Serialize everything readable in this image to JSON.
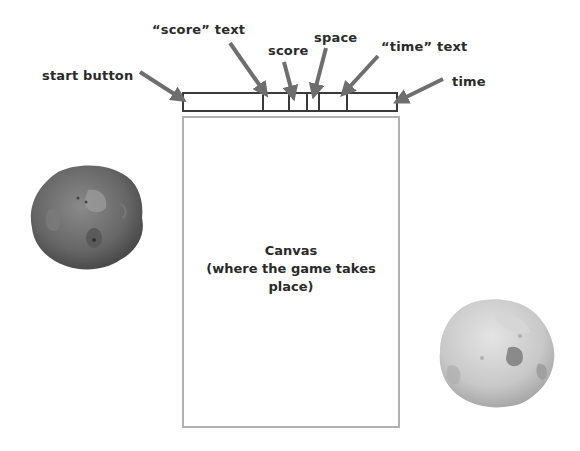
{
  "annotations": {
    "start_button": "start button",
    "score_text": "“score” text",
    "score": "score",
    "space": "space",
    "time_text": "“time” text",
    "time": "time"
  },
  "top_bar": {
    "cells": [
      {
        "name": "start-button",
        "width": 78
      },
      {
        "name": "score-text",
        "width": 26
      },
      {
        "name": "score",
        "width": 18
      },
      {
        "name": "space",
        "width": 12
      },
      {
        "name": "time-text",
        "width": 28
      },
      {
        "name": "time",
        "width": 0
      }
    ]
  },
  "canvas": {
    "title": "Canvas",
    "subtitle": "(where the game takes place)"
  },
  "decorations": {
    "left_asteroid": "dark-asteroid",
    "right_asteroid": "light-asteroid"
  },
  "colors": {
    "arrow": "#6e6e6e",
    "bar_border": "#3a3a3a",
    "canvas_border": "#b0b0b0",
    "text": "#2a2a2a"
  }
}
